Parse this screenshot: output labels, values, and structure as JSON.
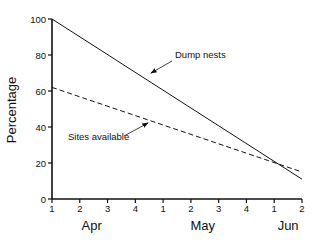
{
  "chart_data": {
    "type": "line",
    "title": "",
    "xlabel": "",
    "ylabel": "Percentage",
    "ylim": [
      0,
      100
    ],
    "yticks": [
      0,
      20,
      40,
      60,
      80,
      100
    ],
    "x_tick_labels": [
      "1",
      "2",
      "3",
      "4",
      "1",
      "2",
      "3",
      "4",
      "1",
      "2"
    ],
    "month_labels": [
      {
        "label": "Apr",
        "at_tick": 1.5
      },
      {
        "label": "May",
        "at_tick": 5.5
      },
      {
        "label": "Jun",
        "at_tick": 8.5
      }
    ],
    "grid": false,
    "legend": "none (inline annotations)",
    "series": [
      {
        "name": "Dump nests",
        "style": "solid",
        "x": [
          0,
          9
        ],
        "values": [
          100,
          11
        ]
      },
      {
        "name": "Sites available",
        "style": "dashed",
        "x": [
          0,
          9
        ],
        "values": [
          62,
          15
        ]
      }
    ],
    "annotations": [
      {
        "text": "Dump nests",
        "points_to": "Dump nests",
        "at_x": 3.6,
        "at_y": 64
      },
      {
        "text": "Sites available",
        "points_to": "Sites available",
        "at_x": 3.5,
        "at_y": 43
      }
    ]
  }
}
